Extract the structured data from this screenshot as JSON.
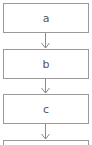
{
  "diagram": {
    "type": "flowchart",
    "direction": "top-to-bottom",
    "nodes": [
      {
        "id": "a",
        "label": "a"
      },
      {
        "id": "b",
        "label": "b"
      },
      {
        "id": "c",
        "label": "c"
      },
      {
        "id": "d",
        "label": ""
      }
    ],
    "edges": [
      {
        "from": "a",
        "to": "b"
      },
      {
        "from": "b",
        "to": "c"
      },
      {
        "from": "c",
        "to": "d"
      }
    ],
    "colors": {
      "stroke": "#9a9a9a",
      "text": "#555555",
      "background": "#ffffff"
    }
  }
}
